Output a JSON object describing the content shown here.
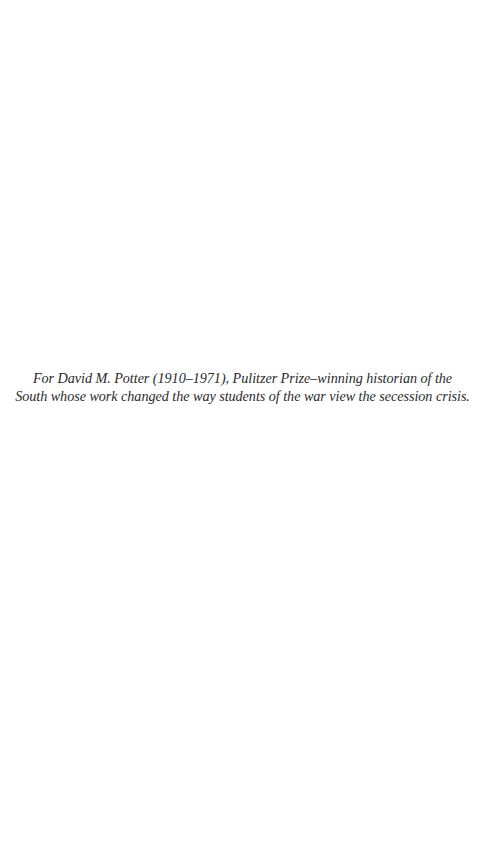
{
  "dedication": {
    "lines": [
      "For David M. Potter (1910–1971), Pulitzer Prize–winning historian of the",
      "South whose work changed the way students of the war view the secession crisis."
    ]
  },
  "colors": {
    "background": "#ffffff",
    "text": "#2a2a2a"
  }
}
